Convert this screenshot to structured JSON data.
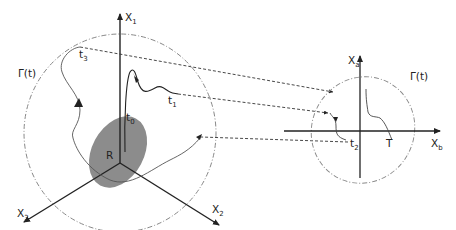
{
  "diagram": {
    "left_frame": {
      "axes": {
        "x1": {
          "label": "X",
          "sub": "1"
        },
        "x2": {
          "label": "X",
          "sub": "2"
        },
        "x3": {
          "label": "X",
          "sub": "3"
        }
      },
      "boundary_label": "Γ(t)",
      "region_label": "R",
      "time_labels": {
        "t0": {
          "label": "t",
          "sub": "0"
        },
        "t1": {
          "label": "t",
          "sub": "1"
        },
        "t3": {
          "label": "t",
          "sub": "3"
        }
      }
    },
    "right_frame": {
      "axes": {
        "xa": {
          "label": "X",
          "sub": "a"
        },
        "xb": {
          "label": "X",
          "sub": "b"
        }
      },
      "boundary_label": "Γ(t)",
      "time_labels": {
        "t2": {
          "label": "t",
          "sub": "2"
        },
        "T": {
          "label": "T"
        }
      }
    },
    "colors": {
      "axis": "#222222",
      "region_fill": "#8c8c8c",
      "boundary": "#888888",
      "trajectory": "#333333",
      "projection": "#333333"
    }
  }
}
